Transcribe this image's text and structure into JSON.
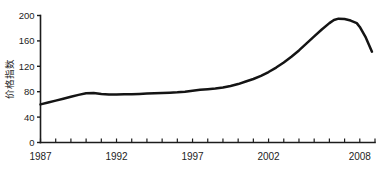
{
  "chart_data": {
    "type": "line",
    "title": "",
    "subtitle": "",
    "xlabel": "",
    "ylabel": "价格指数",
    "xlim": [
      1987,
      2009
    ],
    "ylim": [
      0,
      200
    ],
    "grid": false,
    "legend": null,
    "x_tick_labels": [
      "1987",
      "1992",
      "1997",
      "2002",
      "2008"
    ],
    "x_tick_values": [
      1987,
      1992,
      1997,
      2002,
      2008
    ],
    "x_minor_tick_interval": 1,
    "y_tick_labels": [
      "0",
      "40",
      "80",
      "120",
      "160",
      "200"
    ],
    "y_tick_values": [
      0,
      40,
      80,
      120,
      160,
      200
    ],
    "series": [
      {
        "name": "价格指数",
        "color": "#141414",
        "x": [
          1987,
          1987.5,
          1988,
          1988.5,
          1989,
          1989.5,
          1990,
          1990.5,
          1991,
          1991.5,
          1992,
          1992.5,
          1993,
          1993.5,
          1994,
          1994.5,
          1995,
          1995.5,
          1996,
          1996.5,
          1997,
          1997.5,
          1998,
          1998.5,
          1999,
          1999.5,
          2000,
          2000.5,
          2001,
          2001.5,
          2002,
          2002.5,
          2003,
          2003.5,
          2004,
          2004.5,
          2005,
          2005.5,
          2006,
          2006.3,
          2006.6,
          2007,
          2007.4,
          2007.8,
          2008,
          2008.4,
          2008.8
        ],
        "values": [
          60,
          63,
          66,
          69,
          72,
          75,
          77.5,
          78,
          76.5,
          75.5,
          75.5,
          76,
          76,
          76.5,
          77,
          77.5,
          78,
          78.5,
          79,
          80,
          81.5,
          83,
          84,
          85,
          86.5,
          89,
          92,
          96,
          100,
          105,
          111,
          118,
          126,
          135,
          145,
          156,
          167,
          178,
          188,
          193,
          195,
          194.5,
          192,
          188,
          182,
          165,
          143
        ]
      }
    ]
  },
  "axis": {
    "y_axis_label": "价格指数"
  }
}
